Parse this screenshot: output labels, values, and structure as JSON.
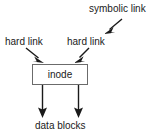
{
  "diagram": {
    "background_color": "#ffffff",
    "line_color": "#1a1a1a",
    "box_border_color": "#6b6b6b",
    "text_color": "#1a1a1a",
    "nodes": {
      "inode_box": {
        "label": "inode"
      }
    },
    "labels": {
      "symbolic_link": "symbolic link",
      "hard_link_left": "hard link",
      "hard_link_right": "hard link",
      "data_blocks": "data blocks"
    },
    "arrows": [
      {
        "name": "symbolic-link-arrow",
        "from_label": "symbolic link",
        "to_label": "hard link",
        "direction": "down-left"
      },
      {
        "name": "hard-link-left-arrow",
        "from_label": "hard link",
        "to_label": "inode",
        "direction": "down-right"
      },
      {
        "name": "hard-link-right-arrow",
        "from_label": "hard link",
        "to_label": "inode",
        "direction": "down-left"
      },
      {
        "name": "inode-to-data-blocks-arrow-left",
        "from_label": "inode",
        "to_label": "data blocks",
        "direction": "down"
      },
      {
        "name": "inode-to-data-blocks-arrow-right",
        "from_label": "inode",
        "to_label": "data blocks",
        "direction": "down"
      }
    ]
  }
}
